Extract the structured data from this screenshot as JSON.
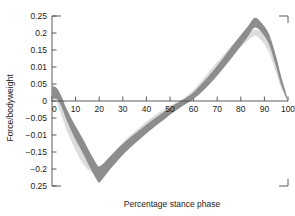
{
  "chart_data": {
    "type": "area",
    "title": "",
    "xlabel": "Percentage stance phase",
    "ylabel": "Force/bodyweight",
    "xlim": [
      0,
      100
    ],
    "ylim": [
      -0.25,
      0.25
    ],
    "grid": false,
    "legend": null,
    "xticks": [
      0,
      10,
      20,
      30,
      40,
      50,
      60,
      70,
      80,
      90,
      100
    ],
    "xtick_labels": [
      "0",
      "10",
      "20",
      "30",
      "40",
      "50",
      "60",
      "70",
      "80",
      "90",
      "100"
    ],
    "yticks": [
      0.25,
      0.2,
      0.15,
      0.1,
      0.05,
      0,
      -0.05,
      -0.1,
      -0.15,
      -0.2,
      -0.25
    ],
    "ytick_labels": [
      "0.25",
      "0.2",
      "0.15",
      "0.01",
      "0.05",
      "0",
      "−0.05",
      "−0.01",
      "−0.15",
      "−0.2",
      "0.25"
    ],
    "colors": {
      "band_light": "#dcdcdc",
      "band_dark": "#8d8d8d",
      "axis": "#4a4a4a",
      "text": "#1b1b1b",
      "background": "#ffffff"
    },
    "series": [
      {
        "name": "band-light",
        "type": "band",
        "color": "#dcdcdc",
        "x": [
          0,
          2,
          4,
          6,
          9,
          12,
          15,
          18,
          19,
          20,
          23,
          27,
          31,
          35,
          40,
          45,
          50,
          54,
          58,
          62,
          67,
          72,
          77,
          82,
          86,
          89,
          92,
          95,
          97,
          100
        ],
        "upper": [
          0.04,
          0.022,
          -0.01,
          -0.045,
          -0.09,
          -0.13,
          -0.165,
          -0.19,
          -0.196,
          -0.198,
          -0.176,
          -0.145,
          -0.115,
          -0.09,
          -0.06,
          -0.035,
          -0.014,
          0.0,
          0.02,
          0.048,
          0.09,
          0.13,
          0.17,
          0.198,
          0.21,
          0.2,
          0.17,
          0.11,
          0.06,
          0.0
        ],
        "lower": [
          0.012,
          -0.004,
          -0.042,
          -0.082,
          -0.13,
          -0.172,
          -0.2,
          -0.214,
          -0.216,
          -0.214,
          -0.196,
          -0.168,
          -0.14,
          -0.116,
          -0.086,
          -0.058,
          -0.032,
          -0.014,
          0.004,
          0.026,
          0.062,
          0.098,
          0.138,
          0.172,
          0.192,
          0.176,
          0.142,
          0.082,
          0.04,
          0.0
        ]
      },
      {
        "name": "band-dark",
        "type": "band",
        "color": "#8d8d8d",
        "x": [
          0,
          2,
          4,
          6,
          9,
          13,
          16,
          19,
          20,
          22,
          25,
          29,
          33,
          37,
          41,
          45,
          49,
          53,
          56,
          60,
          64,
          69,
          74,
          79,
          83,
          86,
          89,
          92,
          95,
          97,
          100
        ],
        "upper": [
          0.044,
          0.038,
          0.014,
          -0.02,
          -0.062,
          -0.11,
          -0.15,
          -0.186,
          -0.192,
          -0.182,
          -0.16,
          -0.132,
          -0.108,
          -0.086,
          -0.064,
          -0.044,
          -0.024,
          -0.006,
          0.006,
          0.026,
          0.055,
          0.095,
          0.14,
          0.185,
          0.22,
          0.245,
          0.228,
          0.196,
          0.13,
          0.075,
          0.004
        ],
        "lower": [
          0.004,
          0.006,
          -0.016,
          -0.052,
          -0.1,
          -0.152,
          -0.194,
          -0.232,
          -0.24,
          -0.224,
          -0.198,
          -0.166,
          -0.138,
          -0.114,
          -0.09,
          -0.068,
          -0.046,
          -0.026,
          -0.012,
          0.006,
          0.03,
          0.066,
          0.108,
          0.152,
          0.19,
          0.216,
          0.2,
          0.166,
          0.1,
          0.05,
          -0.004
        ]
      }
    ]
  }
}
